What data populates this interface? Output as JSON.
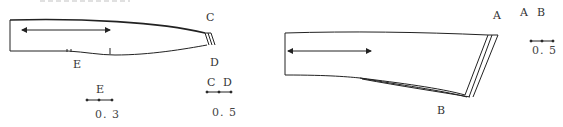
{
  "figure": {
    "left_piece": {
      "labels": {
        "top_corner": "C",
        "bottom_corner": "D",
        "notch": "E"
      },
      "legend_E": {
        "label": "E",
        "value": "0. 3"
      },
      "legend_CD": {
        "label_1": "C",
        "label_2": "D",
        "value": "0. 5"
      }
    },
    "right_piece": {
      "labels": {
        "top_corner": "A",
        "bottom_corner": "B"
      },
      "legend_AB": {
        "label_1": "A",
        "label_2": "B",
        "value": "0. 5"
      }
    }
  },
  "colors": {
    "line": "#222222",
    "background": "#ffffff"
  }
}
